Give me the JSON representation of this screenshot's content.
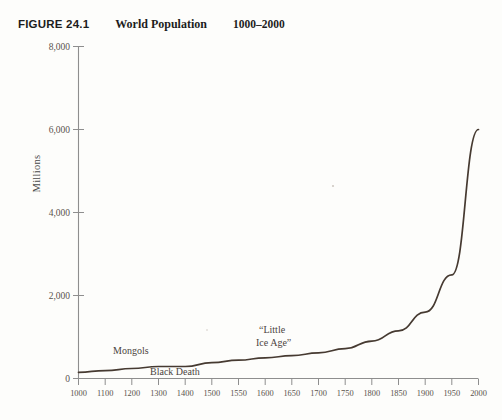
{
  "caption": {
    "figure_number": "FIGURE 24.1",
    "title": "World Population",
    "range": "1000–2000"
  },
  "axes": {
    "y_label": "Millions",
    "y_ticks": [
      "0",
      "2,000",
      "4,000",
      "6,000",
      "8,000"
    ],
    "x_ticks": [
      "1000",
      "1100",
      "1200",
      "1300",
      "1400",
      "1500",
      "1550",
      "1600",
      "1650",
      "1700",
      "1750",
      "1800",
      "1850",
      "1900",
      "1950",
      "2000"
    ]
  },
  "annotations": [
    {
      "name": "mongols",
      "text": "Mongols"
    },
    {
      "name": "black-death",
      "text": "Black Death"
    },
    {
      "name": "little-ice-age-line1",
      "text": "“Little"
    },
    {
      "name": "little-ice-age-line2",
      "text": "Ice Age”"
    }
  ],
  "colors": {
    "line": "#463a31",
    "axis": "#8e8e8e",
    "text": "#2b2b2b",
    "background": "#fdfdfb"
  },
  "chart_data": {
    "type": "line",
    "title": "World Population 1000–2000",
    "xlabel": "",
    "ylabel": "Millions",
    "ylim": [
      0,
      8000
    ],
    "grid": false,
    "legend": "none",
    "x_axis_note": "non-uniform category axis: 100-year steps to 1500, then 50-year steps to 2000",
    "categories": [
      "1000",
      "1100",
      "1200",
      "1300",
      "1400",
      "1500",
      "1550",
      "1600",
      "1650",
      "1700",
      "1750",
      "1800",
      "1850",
      "1900",
      "1950",
      "2000"
    ],
    "series": [
      {
        "name": "World population",
        "values": [
          150,
          190,
          240,
          290,
          290,
          380,
          440,
          500,
          550,
          620,
          720,
          900,
          1150,
          1600,
          2500,
          6000
        ]
      }
    ],
    "annotations": [
      {
        "text": "Mongols",
        "x": "1200",
        "y": 520
      },
      {
        "text": "Black Death",
        "x": "1350",
        "y": 150
      },
      {
        "text": "“Little Ice Age”",
        "x": "1650",
        "y": 1150
      }
    ]
  }
}
